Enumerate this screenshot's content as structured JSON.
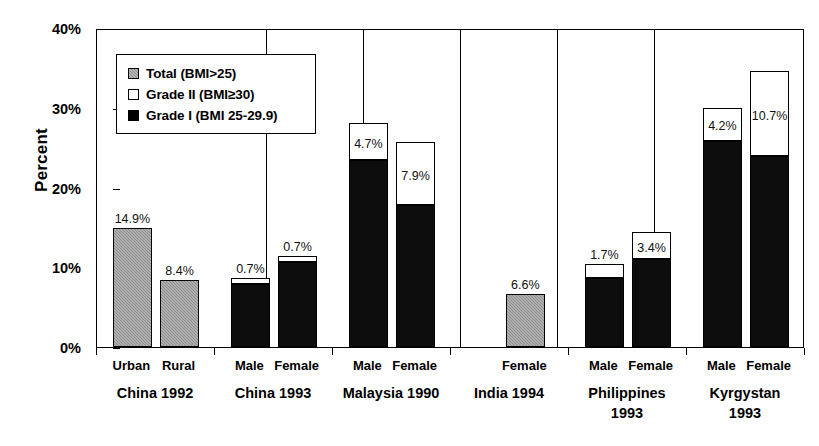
{
  "chart_data": {
    "type": "bar",
    "subtype": "stacked-bar-grouped",
    "title": "",
    "xlabel": "",
    "ylabel": "Percent",
    "ylim": [
      0,
      40
    ],
    "ytick_labels": [
      "0%",
      "10%",
      "20%",
      "30%",
      "40%"
    ],
    "ytick_values": [
      0,
      10,
      20,
      30,
      40
    ],
    "grid": false,
    "legend_position": "upper-left-inside",
    "legend": [
      {
        "key": "total",
        "label": "Total (BMI>25)",
        "swatch": "gray-hatched"
      },
      {
        "key": "grade2",
        "label": "Grade II (BMI≥30)",
        "swatch": "white"
      },
      {
        "key": "grade1",
        "label": "Grade I (BMI 25-29.9)",
        "swatch": "black"
      }
    ],
    "series": [
      {
        "name": "Grade I (BMI 25-29.9)",
        "key": "grade1",
        "color": "#0d0d0d"
      },
      {
        "name": "Grade II (BMI≥30)",
        "key": "grade2",
        "color": "#ffffff"
      },
      {
        "name": "Total (BMI>25)",
        "key": "total",
        "color": "#8d8d8d"
      }
    ],
    "groups": [
      {
        "group_label": "China 1992",
        "bars": [
          {
            "category": "Urban",
            "mode": "total",
            "total": 14.9,
            "grade1": null,
            "grade2": null,
            "label": "14.9%"
          },
          {
            "category": "Rural",
            "mode": "total",
            "total": 8.4,
            "grade1": null,
            "grade2": null,
            "label": "8.4%"
          }
        ]
      },
      {
        "group_label": "China 1993",
        "bars": [
          {
            "category": "Male",
            "mode": "stacked",
            "total": 8.6,
            "grade1": 7.9,
            "grade2": 0.7,
            "label": "0.7%"
          },
          {
            "category": "Female",
            "mode": "stacked",
            "total": 11.4,
            "grade1": 10.7,
            "grade2": 0.7,
            "label": "0.7%"
          }
        ]
      },
      {
        "group_label": "Malaysia 1990",
        "bars": [
          {
            "category": "Male",
            "mode": "stacked",
            "total": 28.1,
            "grade1": 23.4,
            "grade2": 4.7,
            "label": "4.7%"
          },
          {
            "category": "Female",
            "mode": "stacked",
            "total": 25.7,
            "grade1": 17.8,
            "grade2": 7.9,
            "label": "7.9%"
          }
        ]
      },
      {
        "group_label": "India 1994",
        "bars": [
          {
            "category": "Female",
            "mode": "total",
            "total": 6.6,
            "grade1": null,
            "grade2": null,
            "label": "6.6%"
          }
        ]
      },
      {
        "group_label": "Philippines 1993",
        "bars": [
          {
            "category": "Male",
            "mode": "stacked",
            "total": 10.4,
            "grade1": 8.7,
            "grade2": 1.7,
            "label": "1.7%"
          },
          {
            "category": "Female",
            "mode": "stacked",
            "total": 14.4,
            "grade1": 11.0,
            "grade2": 3.4,
            "label": "3.4%"
          }
        ]
      },
      {
        "group_label": "Kyrgystan 1993",
        "bars": [
          {
            "category": "Male",
            "mode": "stacked",
            "total": 30.0,
            "grade1": 25.8,
            "grade2": 4.2,
            "label": "4.2%"
          },
          {
            "category": "Female",
            "mode": "stacked",
            "total": 34.6,
            "grade1": 23.9,
            "grade2": 10.7,
            "label": "10.7%"
          }
        ]
      }
    ]
  },
  "axis": {
    "y_title": "Percent"
  },
  "layout": {
    "plot": {
      "left": 96,
      "top": 29,
      "width": 708,
      "height": 319
    },
    "group_separators_x": [
      168,
      265,
      362,
      459,
      556,
      653
    ],
    "groups_px": [
      {
        "x0": 96,
        "x1": 168,
        "bars": [
          {
            "x": 112,
            "w": 38
          },
          {
            "x": 164,
            "w": 38
          }
        ]
      },
      {
        "x0": 168,
        "x1": 265,
        "bars": [
          {
            "x": 178,
            "w": 36
          },
          {
            "x": 229,
            "w": 36
          }
        ]
      },
      {
        "x0": 265,
        "x1": 362,
        "bars": [
          {
            "x": 278,
            "w": 36
          },
          {
            "x": 329,
            "w": 36
          }
        ]
      },
      {
        "x0": 362,
        "x1": 459,
        "bars": [
          {
            "x": 478,
            "w": 38
          }
        ]
      },
      {
        "x0": 459,
        "x1": 556,
        "bars": [
          {
            "x": 568,
            "w": 36
          },
          {
            "x": 619,
            "w": 36
          }
        ]
      },
      {
        "x0": 556,
        "x1": 653,
        "bars": [
          {
            "x": 694,
            "w": 38
          },
          {
            "x": 748,
            "w": 38
          }
        ]
      }
    ]
  }
}
